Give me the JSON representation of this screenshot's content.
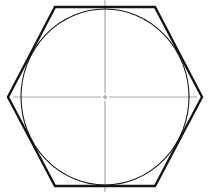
{
  "figure": {
    "title": "Hexagon with inscribed circle",
    "canvas": {
      "width": 211,
      "height": 194,
      "background": "#ffffff"
    },
    "colors": {
      "outline": "#141414",
      "circle": "#1a1a1a",
      "centerline": "#aaaaaa",
      "background": "#ffffff"
    },
    "hexagon": {
      "name": "hexagon-outline",
      "stroke": "#141414",
      "stroke_width": 2.4,
      "fill": "none",
      "points": "55,7 155,7 202,97 155,186 55,186 8,97",
      "vertices": [
        {
          "label": "top-left",
          "x": 55,
          "y": 7
        },
        {
          "label": "top-right",
          "x": 155,
          "y": 7
        },
        {
          "label": "right",
          "x": 202,
          "y": 97
        },
        {
          "label": "bottom-right",
          "x": 155,
          "y": 186
        },
        {
          "label": "bottom-left",
          "x": 55,
          "y": 186
        },
        {
          "label": "left",
          "x": 8,
          "y": 97
        }
      ]
    },
    "circle": {
      "name": "inscribed-circle",
      "stroke": "#1a1a1a",
      "stroke_width": 1.1,
      "fill": "none",
      "cx": 105,
      "cy": 97,
      "rx": 84,
      "ry": 88
    },
    "centerlines": {
      "stroke": "#aaaaaa",
      "stroke_width": 1.2,
      "center_mark": {
        "cx": 105,
        "cy": 97,
        "gap": 4,
        "tick": 5
      },
      "vertical": {
        "x": 105,
        "y1": 0,
        "y2": 192
      },
      "horizontal": {
        "y": 97,
        "x1": 13,
        "x2": 197
      }
    }
  }
}
